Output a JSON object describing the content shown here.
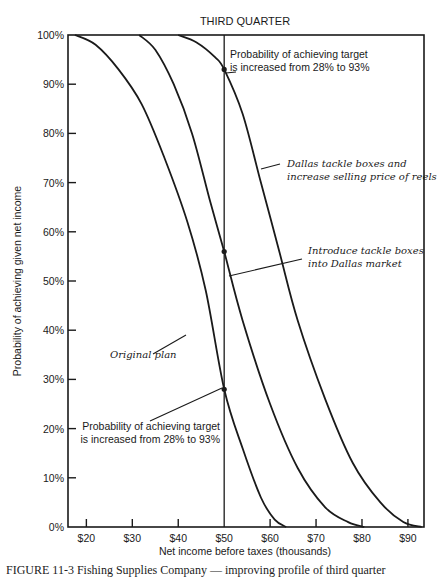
{
  "chart_data": {
    "type": "line",
    "title": "THIRD QUARTER",
    "xlabel": "Net income before taxes (thousands)",
    "ylabel": "Probability of achieving given net income",
    "xlim": [
      16,
      93.5
    ],
    "ylim": [
      0,
      100
    ],
    "x_ticks": [
      20,
      30,
      40,
      50,
      60,
      70,
      80,
      90
    ],
    "x_tick_labels": [
      "$20",
      "$30",
      "$40",
      "$50",
      "$60",
      "$70",
      "$80",
      "$90"
    ],
    "y_ticks": [
      0,
      10,
      20,
      30,
      40,
      50,
      60,
      70,
      80,
      90,
      100
    ],
    "y_tick_labels": [
      "0%",
      "10%",
      "20%",
      "30%",
      "40%",
      "50%",
      "60%",
      "70%",
      "80%",
      "90%",
      "100%"
    ],
    "grid": false,
    "target_line_x": 50,
    "series": [
      {
        "name": "Original plan",
        "x": [
          17.5,
          22,
          27,
          32,
          37,
          42,
          46,
          50,
          54,
          58,
          61,
          63.5
        ],
        "y": [
          100,
          98,
          93,
          86,
          75,
          62,
          48,
          28,
          16,
          6,
          1.5,
          0
        ]
      },
      {
        "name": "Introduce tackle boxes into Dallas market",
        "x": [
          31.5,
          35,
          39,
          43,
          47,
          50,
          54,
          60,
          66,
          72,
          77,
          80.5
        ],
        "y": [
          100,
          97,
          90,
          80,
          66,
          56,
          42,
          25,
          12,
          4,
          1,
          0
        ]
      },
      {
        "name": "Dallas tackle boxes and increase selling price of reels",
        "x": [
          40,
          44,
          48,
          50,
          54,
          58,
          62,
          66,
          72,
          78,
          84,
          89,
          93
        ],
        "y": [
          100,
          98.5,
          95.5,
          93,
          84,
          70,
          56,
          42,
          26,
          13,
          5,
          1,
          0
        ]
      }
    ],
    "markers": [
      {
        "x": 50,
        "y": 93
      },
      {
        "x": 50,
        "y": 56
      },
      {
        "x": 50,
        "y": 28
      }
    ],
    "annotations": [
      {
        "id": "top",
        "lines": [
          "Probability of achieving target",
          "is increased from 28% to 93%"
        ],
        "style": "sans",
        "x": 230,
        "y": 58,
        "anchor": "start",
        "leader": [
          236,
          72,
          226,
          73
        ]
      },
      {
        "id": "dallas-price",
        "lines": [
          "Dallas tackle boxes and",
          "increase selling price of reels"
        ],
        "style": "serif-it",
        "x": 287,
        "y": 167,
        "anchor": "start",
        "leader": [
          280,
          164,
          261,
          169
        ]
      },
      {
        "id": "dallas",
        "lines": [
          "Introduce tackle boxes",
          "into Dallas market"
        ],
        "style": "serif-it",
        "x": 308,
        "y": 254,
        "anchor": "start",
        "leader": [
          302,
          259,
          229,
          276
        ]
      },
      {
        "id": "original",
        "lines": [
          "Original plan"
        ],
        "style": "serif-it",
        "x": 110,
        "y": 358,
        "anchor": "start",
        "leader": [
          153,
          354,
          186,
          335
        ]
      },
      {
        "id": "bottom",
        "lines": [
          "Probability of achieving target",
          "is increased from 28% to 93%"
        ],
        "style": "sans",
        "x": 220,
        "y": 430,
        "anchor": "end",
        "leader": [
          150,
          421,
          222,
          388
        ]
      }
    ]
  },
  "caption": "FIGURE 11-3  Fishing Supplies Company — improving profile of third quarter"
}
